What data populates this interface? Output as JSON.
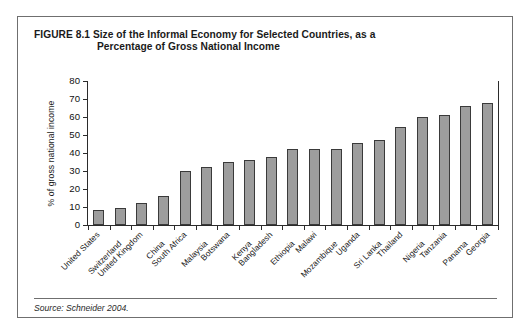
{
  "figure": {
    "number": "FIGURE 8.1",
    "title_line1": "Size of the Informal Economy for Selected Countries, as a",
    "title_line2": "Percentage of Gross National Income",
    "source": "Source: Schneider 2004."
  },
  "chart_data": {
    "type": "bar",
    "title": "Size of the Informal Economy for Selected Countries, as a Percentage of Gross National Income",
    "xlabel": "",
    "ylabel": "% of gross national income",
    "ylim": [
      0,
      80
    ],
    "ytick_step": 10,
    "yticks": [
      0,
      10,
      20,
      30,
      40,
      50,
      60,
      70,
      80
    ],
    "ytick_labels": [
      "0",
      "10",
      "20",
      "30",
      "40",
      "50",
      "60",
      "70",
      "80"
    ],
    "grid": false,
    "legend": "none",
    "bar_color": "#9d9d9d",
    "bar_edge_color": "#3a3a3a",
    "categories": [
      "United States",
      "Switzerland",
      "United Kingdom",
      "China",
      "South Africa",
      "Malaysia",
      "Botswana",
      "Kenya",
      "Bangladesh",
      "Ethiopia",
      "Malawi",
      "Mozambique",
      "Uganda",
      "Sri Lanka",
      "Thailand",
      "Nigeria",
      "Tanzania",
      "Panama",
      "Georgia"
    ],
    "values": [
      8.5,
      9.5,
      12.5,
      16,
      30,
      32,
      35,
      36,
      38,
      42,
      42,
      42.5,
      45.5,
      47.5,
      54.5,
      60,
      61,
      66,
      68
    ]
  }
}
